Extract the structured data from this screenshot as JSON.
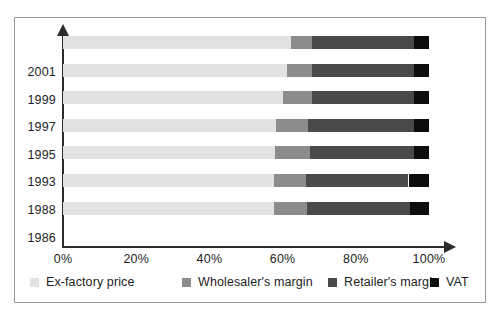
{
  "chart_data": {
    "type": "bar",
    "orientation": "horizontal",
    "stacked": true,
    "normalized_percent": true,
    "title": "",
    "subtitle": "",
    "xlabel": "",
    "ylabel": "",
    "xlim": [
      0,
      100
    ],
    "xticks": [
      0,
      20,
      40,
      60,
      80,
      100
    ],
    "xticklabels": [
      "0%",
      "20%",
      "40%",
      "60%",
      "80%",
      "100%"
    ],
    "grid": false,
    "legend_position": "bottom",
    "categories": [
      "2001",
      "1999",
      "1997",
      "1995",
      "1993",
      "1988",
      "1986"
    ],
    "series": [
      {
        "name": "Ex-factory price",
        "color": "#e2e2e2",
        "values": [
          62.3,
          61.2,
          60.1,
          58.2,
          58.0,
          57.7,
          57.7
        ]
      },
      {
        "name": "Wholesaler's margin",
        "color": "#8c8c8c",
        "values": [
          5.7,
          6.8,
          7.9,
          8.8,
          9.5,
          8.7,
          9.0
        ]
      },
      {
        "name": "Retailer's margin",
        "color": "#4a4a4a",
        "values": [
          28.0,
          28.0,
          28.0,
          29.0,
          28.5,
          28.0,
          28.0
        ]
      },
      {
        "name": "VAT",
        "color": "#0d0d0d",
        "values": [
          4.0,
          4.0,
          4.0,
          4.0,
          4.0,
          5.6,
          5.3
        ]
      }
    ],
    "bars": [
      {
        "category": "2001",
        "segments": [
          {
            "name": "Ex-factory price",
            "start": 0,
            "end": 62.3
          },
          {
            "name": "Wholesaler's margin",
            "start": 62.3,
            "end": 68.0
          },
          {
            "name": "Retailer's margin",
            "start": 68.0,
            "end": 96.0
          },
          {
            "name": "VAT",
            "start": 96.0,
            "end": 100.0
          }
        ]
      },
      {
        "category": "1999",
        "segments": [
          {
            "name": "Ex-factory price",
            "start": 0,
            "end": 61.2
          },
          {
            "name": "Wholesaler's margin",
            "start": 61.2,
            "end": 68.0
          },
          {
            "name": "Retailer's margin",
            "start": 68.0,
            "end": 96.0
          },
          {
            "name": "VAT",
            "start": 96.0,
            "end": 100.0
          }
        ]
      },
      {
        "category": "1997",
        "segments": [
          {
            "name": "Ex-factory price",
            "start": 0,
            "end": 60.1
          },
          {
            "name": "Wholesaler's margin",
            "start": 60.1,
            "end": 68.0
          },
          {
            "name": "Retailer's margin",
            "start": 68.0,
            "end": 96.0
          },
          {
            "name": "VAT",
            "start": 96.0,
            "end": 100.0
          }
        ]
      },
      {
        "category": "1995",
        "segments": [
          {
            "name": "Ex-factory price",
            "start": 0,
            "end": 58.2
          },
          {
            "name": "Wholesaler's margin",
            "start": 58.2,
            "end": 67.0
          },
          {
            "name": "Retailer's margin",
            "start": 67.0,
            "end": 96.0
          },
          {
            "name": "VAT",
            "start": 96.0,
            "end": 100.0
          }
        ]
      },
      {
        "category": "1993",
        "segments": [
          {
            "name": "Ex-factory price",
            "start": 0,
            "end": 58.0
          },
          {
            "name": "Wholesaler's margin",
            "start": 58.0,
            "end": 67.5
          },
          {
            "name": "Retailer's margin",
            "start": 67.5,
            "end": 96.0
          },
          {
            "name": "VAT",
            "start": 96.0,
            "end": 100.0
          }
        ]
      },
      {
        "category": "1988",
        "segments": [
          {
            "name": "Ex-factory price",
            "start": 0,
            "end": 57.7
          },
          {
            "name": "Wholesaler's margin",
            "start": 57.7,
            "end": 66.4
          },
          {
            "name": "Retailer's margin",
            "start": 66.4,
            "end": 94.4
          },
          {
            "name": "VAT",
            "start": 94.4,
            "end": 100.0
          }
        ]
      },
      {
        "category": "1986",
        "segments": [
          {
            "name": "Ex-factory price",
            "start": 0,
            "end": 57.7
          },
          {
            "name": "Wholesaler's margin",
            "start": 57.7,
            "end": 66.7
          },
          {
            "name": "Retailer's margin",
            "start": 66.7,
            "end": 94.7
          },
          {
            "name": "VAT",
            "start": 94.7,
            "end": 100.0
          }
        ]
      }
    ]
  },
  "legend": {
    "items": [
      {
        "label": "Ex-factory price",
        "color": "#e2e2e2"
      },
      {
        "label": "Wholesaler's margin",
        "color": "#8c8c8c"
      },
      {
        "label": "Retailer's margin",
        "color": "#4a4a4a"
      },
      {
        "label": "VAT",
        "color": "#0d0d0d"
      }
    ]
  },
  "colors": {
    "frame_border": "#9b9b9b",
    "axis": "#2b2b2b",
    "text": "#1d1d1d",
    "background": "#ffffff"
  }
}
